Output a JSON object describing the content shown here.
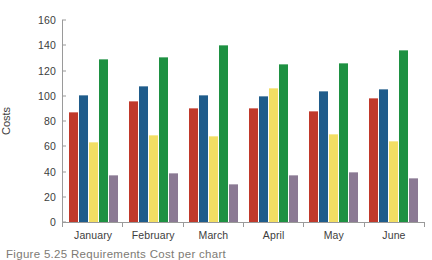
{
  "chart_data": {
    "type": "bar",
    "title": "",
    "subtitle": "",
    "xlabel": "",
    "ylabel": "Costs",
    "categories": [
      "January",
      "February",
      "March",
      "April",
      "May",
      "June"
    ],
    "ylim": [
      0,
      160
    ],
    "yticks": [
      0,
      20,
      40,
      60,
      80,
      100,
      120,
      140,
      160
    ],
    "grid": false,
    "legend": "none",
    "series": [
      {
        "name": "series-1",
        "color": "#C0392B",
        "values": [
          87,
          96,
          90,
          90,
          88,
          98
        ]
      },
      {
        "name": "series-2",
        "color": "#1F5C8B",
        "values": [
          101,
          108,
          101,
          100,
          104,
          105
        ]
      },
      {
        "name": "series-3",
        "color": "#F2DE63",
        "values": [
          63,
          69,
          68,
          106,
          70,
          64
        ]
      },
      {
        "name": "series-4",
        "color": "#1E9142",
        "values": [
          129,
          131,
          140,
          125,
          126,
          136
        ]
      },
      {
        "name": "series-5",
        "color": "#8B7A94",
        "values": [
          37,
          39,
          30,
          37,
          40,
          35
        ]
      }
    ]
  },
  "caption": {
    "text": "Figure 5.25  Requirements Cost per chart"
  },
  "colors": {
    "axis": "#9a9a9a",
    "text": "#3d3d3d",
    "background": "#ffffff",
    "caption": "#7d7a74"
  }
}
